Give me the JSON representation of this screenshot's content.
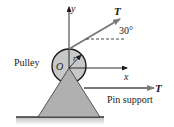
{
  "diagram": {
    "labels": {
      "pulley": "Pulley",
      "origin": "O",
      "radius": "r",
      "x_axis": "x",
      "y_axis": "y",
      "tension_upper": "T",
      "tension_lower": "T",
      "angle": "30°",
      "support": "Pin support"
    },
    "angle_deg": 30,
    "colors": {
      "pulley_fill": "#c8c8c8",
      "support_fill": "#b0b0b0",
      "stroke": "#1a1a1a",
      "arrow": "#7a7a7a",
      "ground": "#333333",
      "ground_shade": "#d0d0d0"
    }
  }
}
